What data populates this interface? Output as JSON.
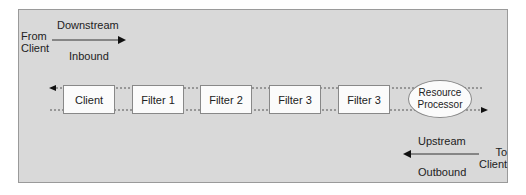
{
  "inbound": {
    "from_label_line1": "From",
    "from_label_line2": "Client",
    "direction": "Downstream",
    "type": "Inbound"
  },
  "outbound": {
    "to_label_line1": "To",
    "to_label_line2": "Client",
    "direction": "Upstream",
    "type": "Outbound"
  },
  "chain": {
    "nodes": [
      {
        "label": "Client"
      },
      {
        "label": "Filter 1"
      },
      {
        "label": "Filter 2"
      },
      {
        "label": "Filter 3"
      },
      {
        "label": "Filter 3"
      }
    ],
    "endpoint_line1": "Resource",
    "endpoint_line2": "Processor"
  },
  "colors": {
    "panel_bg": "#d9d9d9",
    "box_bg": "#fbfbfb",
    "line": "#333333"
  }
}
